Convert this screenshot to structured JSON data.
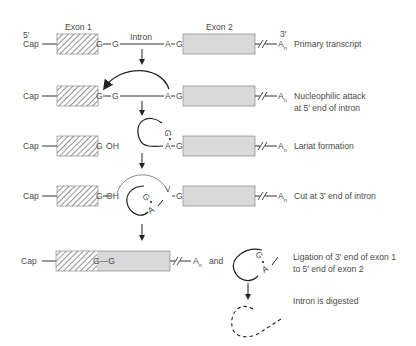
{
  "diagram": {
    "top_labels": {
      "exon1": "Exon 1",
      "intron": "Intron",
      "exon2": "Exon 2",
      "five_prime": "5′",
      "three_prime": "3′"
    },
    "cap_label": "Cap",
    "poly_a": "A",
    "poly_a_sub": "n",
    "bases": {
      "g": "G",
      "a": "A",
      "oh": "OH",
      "gg": "G—G"
    },
    "steps": [
      {
        "label": "Primary transcript"
      },
      {
        "label": "Nucleophilic attack",
        "label2": "at 5′ end of intron"
      },
      {
        "label": "Lariat formation"
      },
      {
        "label": "Cut at 3′ end of intron"
      },
      {
        "label": "Ligation of 3′ end of exon 1",
        "label2": "to 5′ end of exon 2"
      },
      {
        "label": "Intron is digested"
      }
    ],
    "and_label": "and",
    "colors": {
      "exon2_fill": "#d9d9d9",
      "line": "#333333",
      "text": "#4a4a4a"
    }
  }
}
